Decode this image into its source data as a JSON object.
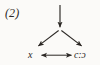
{
  "figure": {
    "number_label": "(2)",
    "background_color": "#fbfaf8",
    "ink_color": "#2b2724",
    "width": 100,
    "height": 65
  },
  "nodes": [
    {
      "id": "apex",
      "label": "",
      "x": 60,
      "y": 29,
      "name": "apex-node"
    },
    {
      "id": "left",
      "label": "x",
      "x": 33,
      "y": 55,
      "name": "left-node"
    },
    {
      "id": "right",
      "label": "c:ɔ",
      "x": 80,
      "y": 55,
      "name": "right-node"
    }
  ],
  "edges": [
    {
      "id": "incoming",
      "name": "incoming-down-arrow",
      "from": "top",
      "to": "apex",
      "arrowheads": "end",
      "x1": 60,
      "y1": 5,
      "x2": 60,
      "y2": 28
    },
    {
      "id": "apex-to-left",
      "name": "apex-to-left-arrow",
      "from": "apex",
      "to": "left",
      "arrowheads": "end",
      "x1": 58,
      "y1": 31,
      "x2": 37,
      "y2": 47
    },
    {
      "id": "apex-to-right",
      "name": "apex-to-right-arrow",
      "from": "apex",
      "to": "right",
      "arrowheads": "end",
      "x1": 62,
      "y1": 31,
      "x2": 83,
      "y2": 47
    },
    {
      "id": "left-right-link",
      "name": "bidirectional-link-arrow",
      "from": "left",
      "to": "right",
      "arrowheads": "both",
      "x1": 40,
      "y1": 55,
      "x2": 72,
      "y2": 55
    }
  ]
}
